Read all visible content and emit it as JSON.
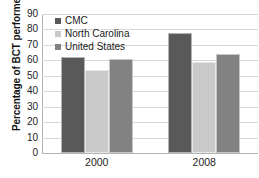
{
  "chart_data": {
    "type": "bar",
    "title": "",
    "xlabel": "",
    "ylabel": "Percentage of BCT performed",
    "categories": [
      "2000",
      "2008"
    ],
    "series": [
      {
        "name": "CMC",
        "values": [
          62,
          78
        ],
        "color": "#595959"
      },
      {
        "name": "North Carolina",
        "values": [
          54,
          59
        ],
        "color": "#c9c9c9"
      },
      {
        "name": "United States",
        "values": [
          61,
          64
        ],
        "color": "#828282"
      }
    ],
    "ylim": [
      0,
      90
    ],
    "ytick_step": 10,
    "yticks": [
      "90",
      "80",
      "70",
      "60",
      "50",
      "40",
      "30",
      "20",
      "10",
      "0"
    ],
    "grid": true,
    "legend_position": "top-left-inside"
  },
  "legend": {
    "items": [
      {
        "label": "CMC",
        "swatch_icon": "square-swatch-icon",
        "color": "#595959"
      },
      {
        "label": "North Carolina",
        "swatch_icon": "square-swatch-icon",
        "color": "#c9c9c9"
      },
      {
        "label": "United States",
        "swatch_icon": "square-swatch-icon",
        "color": "#828282"
      }
    ]
  }
}
